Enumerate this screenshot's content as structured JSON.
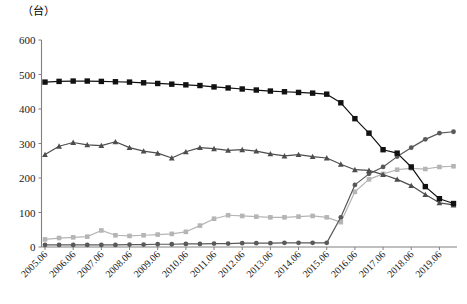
{
  "chart_data": {
    "type": "line",
    "title": "",
    "subtitle": "",
    "unit_label": "（台）",
    "xlabel": "",
    "ylabel": "",
    "ylim": [
      0,
      600
    ],
    "ytick_values": [
      0,
      100,
      200,
      300,
      400,
      500,
      600
    ],
    "ytick_labels": [
      "0",
      "100",
      "200",
      "300",
      "400",
      "500",
      "600"
    ],
    "grid": false,
    "legend": "none",
    "x": [
      "2005.06",
      "2005.12",
      "2006.06",
      "2006.12",
      "2007.06",
      "2007.12",
      "2008.06",
      "2008.12",
      "2009.06",
      "2009.12",
      "2010.06",
      "2010.12",
      "2011.06",
      "2011.12",
      "2012.06",
      "2012.12",
      "2013.06",
      "2013.12",
      "2014.06",
      "2014.12",
      "2015.06",
      "2015.12",
      "2016.06",
      "2016.12",
      "2017.06",
      "2017.12",
      "2018.06",
      "2018.12",
      "2019.06",
      "2019.12"
    ],
    "xtick_labels": [
      "2005.06",
      "2006.06",
      "2007.06",
      "2008.06",
      "2009.06",
      "2010.06",
      "2011.06",
      "2012.06",
      "2013.06",
      "2014.06",
      "2015.06",
      "2016.06",
      "2017.06",
      "2018.06",
      "2019.06"
    ],
    "series": [
      {
        "name": "series-black-square",
        "marker": "square",
        "color": "#111111",
        "values": [
          478,
          480,
          481,
          481,
          480,
          479,
          478,
          476,
          474,
          472,
          470,
          468,
          464,
          461,
          458,
          455,
          452,
          450,
          448,
          446,
          443,
          418,
          372,
          330,
          282,
          272,
          232,
          175,
          140,
          126
        ]
      },
      {
        "name": "series-dark-triangle",
        "marker": "triangle",
        "color": "#4d4d4d",
        "values": [
          268,
          292,
          303,
          296,
          294,
          305,
          288,
          278,
          272,
          258,
          276,
          288,
          285,
          280,
          282,
          278,
          270,
          264,
          268,
          262,
          258,
          240,
          224,
          222,
          210,
          196,
          178,
          152,
          128,
          122
        ]
      },
      {
        "name": "series-light-square",
        "marker": "square",
        "color": "#b5b5b5",
        "values": [
          22,
          26,
          28,
          30,
          48,
          34,
          32,
          34,
          36,
          38,
          44,
          62,
          82,
          92,
          90,
          88,
          86,
          86,
          88,
          90,
          86,
          72,
          160,
          196,
          212,
          224,
          228,
          226,
          232,
          234
        ]
      },
      {
        "name": "series-dark-circle",
        "marker": "circle",
        "color": "#595959",
        "values": [
          6,
          6,
          6,
          6,
          6,
          6,
          7,
          7,
          8,
          8,
          9,
          9,
          10,
          10,
          11,
          11,
          11,
          12,
          12,
          12,
          12,
          86,
          180,
          212,
          232,
          262,
          288,
          312,
          330,
          334
        ]
      }
    ]
  },
  "colors": {
    "axis": "#808080",
    "text": "#1a1a1a",
    "background": "#ffffff"
  }
}
